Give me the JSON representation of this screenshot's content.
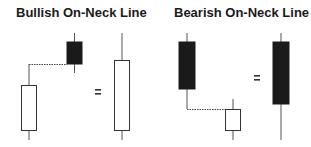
{
  "panels": [
    {
      "title": "Bullish On-Neck Line",
      "equals": "=",
      "candles": [
        {
          "role": "first",
          "color": "white",
          "x": 29,
          "high": 64,
          "open": 131,
          "close": 85,
          "low": 140
        },
        {
          "role": "second",
          "color": "black",
          "x": 74,
          "high": 33,
          "open": 42,
          "close": 64,
          "low": 73
        },
        {
          "role": "combined",
          "color": "white",
          "x": 122,
          "high": 33,
          "open": 131,
          "close": 60,
          "low": 140
        }
      ],
      "connector": {
        "style": "dotted",
        "y": 64,
        "x1": 29,
        "x2": 67
      }
    },
    {
      "title": "Bearish On-Neck Line",
      "equals": "=",
      "candles": [
        {
          "role": "first",
          "color": "black",
          "x": 187,
          "high": 33,
          "open": 42,
          "close": 89,
          "low": 109
        },
        {
          "role": "second",
          "color": "white",
          "x": 233,
          "high": 99,
          "open": 131,
          "close": 109,
          "low": 140
        },
        {
          "role": "combined",
          "color": "black",
          "x": 281,
          "high": 33,
          "open": 42,
          "close": 104,
          "low": 140
        }
      ],
      "connector": {
        "style": "dotted",
        "y": 109,
        "x1": 187,
        "x2": 225
      }
    }
  ],
  "colors": {
    "black_body": "#1a1a1a",
    "white_body": "#ffffff",
    "outline": "#333333",
    "wick": "#555555"
  }
}
